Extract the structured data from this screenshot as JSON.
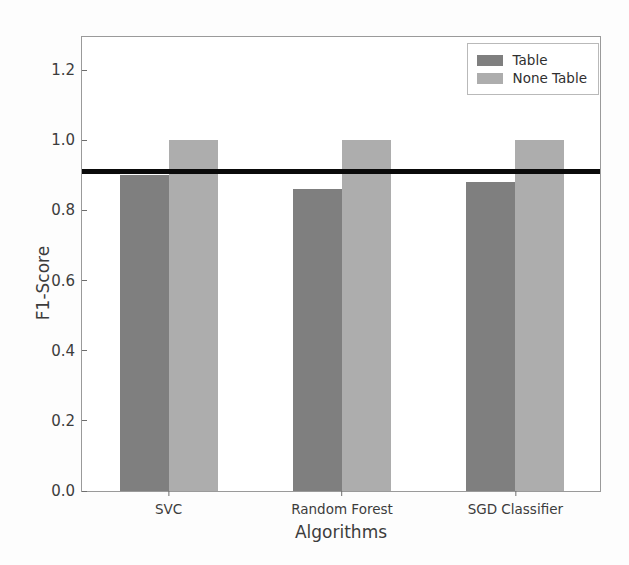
{
  "chart_data": {
    "type": "bar",
    "title": "",
    "xlabel": "Algorithms",
    "ylabel": "F1-Score",
    "categories": [
      "SVC",
      "Random Forest",
      "SGD Classifier"
    ],
    "series": [
      {
        "name": "Table",
        "color": "#7f7f7f",
        "values": [
          0.9,
          0.86,
          0.88
        ]
      },
      {
        "name": "None Table",
        "color": "#adadad",
        "values": [
          1.0,
          1.0,
          1.0
        ]
      }
    ],
    "ylim": [
      0.0,
      1.3
    ],
    "yticks": [
      "0.0",
      "0.2",
      "0.4",
      "0.6",
      "0.8",
      "1.0",
      "1.2"
    ],
    "ytick_values": [
      0.0,
      0.2,
      0.4,
      0.6,
      0.8,
      1.0,
      1.2
    ],
    "grid": false,
    "legend_position": "upper right",
    "annotations": [
      {
        "name": "threshold-line",
        "type": "hline",
        "value": 0.91,
        "color": "#0a0a0a",
        "label": ""
      }
    ]
  },
  "legend": {
    "entries": [
      {
        "label": "Table",
        "swatch": "series-table"
      },
      {
        "label": "None Table",
        "swatch": "series-none"
      }
    ]
  },
  "axes": {
    "y_title": "F1-Score",
    "x_title": "Algorithms"
  }
}
